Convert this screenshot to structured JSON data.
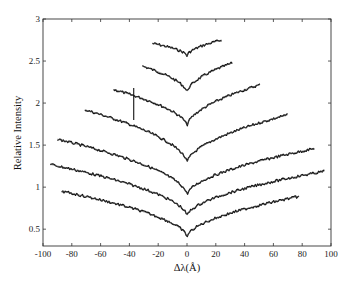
{
  "chart_data": {
    "type": "line",
    "title": "",
    "xlabel": "Δλ(Å)",
    "ylabel": "Relative Intensity",
    "xlim": [
      -100,
      100
    ],
    "ylim": [
      0.3,
      3
    ],
    "x_ticks": [
      -100,
      -80,
      -60,
      -40,
      -20,
      0,
      20,
      40,
      60,
      80,
      100
    ],
    "y_ticks": [
      0.5,
      1,
      1.5,
      2,
      2.5,
      3
    ],
    "x_tick_labels": [
      "-100",
      "-80",
      "-60",
      "-40",
      "-20",
      "0",
      "20",
      "40",
      "60",
      "80",
      "100"
    ],
    "y_tick_labels": [
      "0.5",
      "1",
      "1.5",
      "2",
      "2.5",
      "3"
    ],
    "grid": false,
    "legend": null,
    "series": [
      {
        "name": "curve-1",
        "x_left": -24,
        "y_left": 2.71,
        "y_min": 2.56,
        "x_right": 24,
        "y_right": 2.75
      },
      {
        "name": "curve-2",
        "x_left": -31,
        "y_left": 2.44,
        "y_min": 2.12,
        "x_right": 32,
        "y_right": 2.48
      },
      {
        "name": "curve-3",
        "x_left": -51,
        "y_left": 2.16,
        "y_min": 1.72,
        "x_right": 51,
        "y_right": 2.22,
        "glitch": {
          "x": -37,
          "y_from": 2.18,
          "y_to": 1.8
        }
      },
      {
        "name": "curve-4",
        "x_left": -71,
        "y_left": 1.92,
        "y_min": 1.28,
        "x_right": 70,
        "y_right": 1.86
      },
      {
        "name": "curve-5",
        "x_left": -90,
        "y_left": 1.57,
        "y_min": 0.9,
        "x_right": 89,
        "y_right": 1.46
      },
      {
        "name": "curve-6",
        "x_left": -95,
        "y_left": 1.27,
        "y_min": 0.65,
        "x_right": 96,
        "y_right": 1.19
      },
      {
        "name": "curve-7",
        "x_left": -87,
        "y_left": 0.95,
        "y_min": 0.4,
        "x_right": 78,
        "y_right": 0.89
      }
    ]
  }
}
